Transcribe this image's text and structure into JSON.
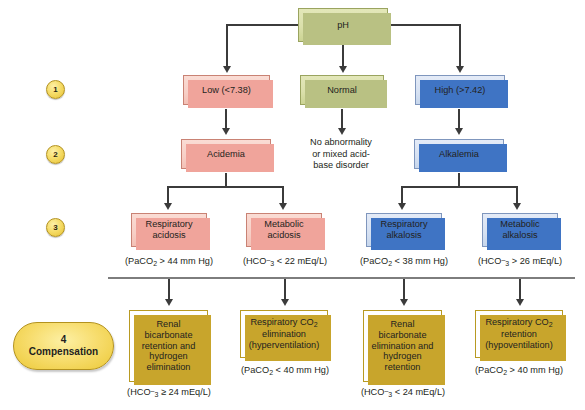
{
  "diagram": {
    "steps": [
      {
        "id": "step-1",
        "number": "1"
      },
      {
        "id": "step-2",
        "number": "2"
      },
      {
        "id": "step-3",
        "number": "3"
      }
    ],
    "compensation_marker": {
      "number": "4",
      "label": "Compensation"
    },
    "root": {
      "label": "pH",
      "color": "#dbe0ab"
    },
    "level1": [
      {
        "label": "Low (<7.38)",
        "color": "#f7cfc6"
      },
      {
        "label": "Normal",
        "color": "#dbe0ab"
      },
      {
        "label": "High (>7.42)",
        "color": "#d6e1f2"
      }
    ],
    "level2": [
      {
        "label": "Acidemia",
        "color": "#f7cfc6"
      },
      {
        "label": "No abnormality or mixed acid-base disorder",
        "line1": "No abnormality",
        "line2": "or mixed acid-",
        "line3": "base disorder",
        "boxed": "false"
      },
      {
        "label": "Alkalemia",
        "color": "#d6e1f2"
      }
    ],
    "level3": [
      {
        "line1": "Respiratory",
        "line2": "acidosis",
        "color": "#f7cfc6",
        "criterion_prefix": "(PaCO",
        "criterion_sub": "2",
        "criterion_suffix": " > 44 mm Hg)"
      },
      {
        "line1": "Metabolic",
        "line2": "acidosis",
        "color": "#f7cfc6",
        "criterion_prefix": "(HCO",
        "criterion_sub": "3",
        "criterion_sup": "–",
        "criterion_suffix": " < 22 mEq/L)"
      },
      {
        "line1": "Respiratory",
        "line2": "alkalosis",
        "color": "#d6e1f2",
        "criterion_prefix": "(PaCO",
        "criterion_sub": "2",
        "criterion_suffix": " < 38 mm Hg)"
      },
      {
        "line1": "Metabolic",
        "line2": "alkalosis",
        "color": "#d6e1f2",
        "criterion_prefix": "(HCO",
        "criterion_sub": "3",
        "criterion_sup": "–",
        "criterion_suffix": " > 26 mEq/L)"
      }
    ],
    "level4": [
      {
        "lines": [
          "Renal",
          "bicarbonate",
          "retention and",
          "hydrogen",
          "elimination"
        ],
        "color": "#f5d761",
        "criterion_prefix": "(HCO",
        "criterion_sub": "3",
        "criterion_sup": "–",
        "criterion_suffix": " ≥ 24 mEq/L)"
      },
      {
        "lines": [
          "Respiratory CO₂",
          "elimination",
          "(hyperventilation)"
        ],
        "color": "#f5d761",
        "criterion_prefix": "(PaCO",
        "criterion_sub": "2",
        "criterion_suffix": " < 40 mm Hg)"
      },
      {
        "lines": [
          "Renal",
          "bicarbonate",
          "elimination and",
          "hydrogen",
          "retention"
        ],
        "color": "#f5d761",
        "criterion_prefix": "(HCO",
        "criterion_sub": "3",
        "criterion_sup": "–",
        "criterion_suffix": " < 24 mEq/L)"
      },
      {
        "lines": [
          "Respiratory CO₂",
          "retention",
          "(hypoventilation)"
        ],
        "color": "#f5d761",
        "criterion_prefix": "(PaCO",
        "criterion_sub": "2",
        "criterion_suffix": " > 40 mm Hg)"
      }
    ],
    "comp_box_text": {
      "b1_l1": "Renal",
      "b1_l2": "bicarbonate",
      "b1_l3": "retention and",
      "b1_l4": "hydrogen",
      "b1_l5": "elimination",
      "b2_l1": "Respiratory CO",
      "b2_l1_sub": "2",
      "b2_l2": "elimination",
      "b2_l3": "(hyperventilation)",
      "b3_l1": "Renal",
      "b3_l2": "bicarbonate",
      "b3_l3": "elimination and",
      "b3_l4": "hydrogen",
      "b3_l5": "retention",
      "b4_l1": "Respiratory CO",
      "b4_l1_sub": "2",
      "b4_l2": "retention",
      "b4_l3": "(hypoventilation)"
    },
    "colors": {
      "green": "#dbe0ab",
      "pink": "#f7cfc6",
      "blue": "#d6e1f2",
      "yellow": "#f5d761",
      "line": "#3b3b3b",
      "divider": "#7d7d7d"
    }
  }
}
